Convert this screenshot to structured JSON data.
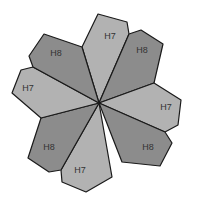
{
  "diagram": {
    "colors": {
      "H7": "#b2b2b2",
      "H8": "#8c8c8c",
      "stroke": "#1a1a1a"
    },
    "petals": [
      {
        "label": "H7",
        "type": "H7",
        "points": "99,103 82,47 98,14 127,22 129,34",
        "lx": 110,
        "ly": 37
      },
      {
        "label": "H8",
        "type": "H8",
        "points": "99,103 129,34 141,30 163,44 154,83",
        "lx": 142,
        "ly": 51
      },
      {
        "label": "H7",
        "type": "H7",
        "points": "99,103 154,83 181,100 178,125 165,132",
        "lx": 166,
        "ly": 108
      },
      {
        "label": "H8",
        "type": "H8",
        "points": "99,103 165,132 172,143 160,166 122,162",
        "lx": 148,
        "ly": 148
      },
      {
        "label": "H7",
        "type": "H7",
        "points": "99,103 112,177 86,192 62,182 61,170",
        "lx": 80,
        "ly": 171
      },
      {
        "label": "H8",
        "type": "H8",
        "points": "99,103 61,170 49,172 28,158 41,118",
        "lx": 49,
        "ly": 148
      },
      {
        "label": "H7",
        "type": "H7",
        "points": "99,103 41,118 12,93 21,70 33,67",
        "lx": 28,
        "ly": 89
      },
      {
        "label": "H8",
        "type": "H8",
        "points": "99,103 33,67 29,56 44,34 82,47",
        "lx": 56,
        "ly": 54
      }
    ]
  }
}
